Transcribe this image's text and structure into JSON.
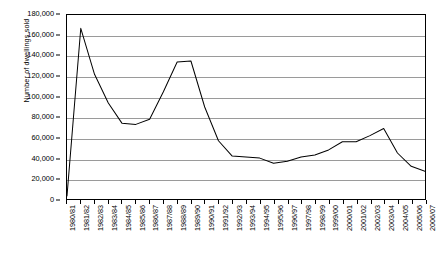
{
  "chart_data": {
    "type": "line",
    "title": "",
    "xlabel": "",
    "ylabel": "Number of dwellings sold",
    "ylim": [
      0,
      180000
    ],
    "ytick_step": 20000,
    "grid": true,
    "legend": false,
    "line_color": "#000000",
    "grid_color": "#9a9a9a",
    "axis_color": "#000000",
    "background": "#ffffff",
    "y_ticks": [
      "0",
      "20,000",
      "40,000",
      "60,000",
      "80,000",
      "100,000",
      "120,000",
      "140,000",
      "160,000",
      "180,000"
    ],
    "y_tick_values": [
      0,
      20000,
      40000,
      60000,
      80000,
      100000,
      120000,
      140000,
      160000,
      180000
    ],
    "categories": [
      "1980/81",
      "1981/82",
      "1982/83",
      "1983/84",
      "1984/85",
      "1985/86",
      "1986/87",
      "1987/88",
      "1988/89",
      "1989/90",
      "1990/91",
      "1991/92",
      "1992/93",
      "1993/94",
      "1994/95",
      "1995/96",
      "1996/97",
      "1997/98",
      "1998/99",
      "1999/00",
      "2000/01",
      "2001/02",
      "2002/03",
      "2003/04",
      "2004/05",
      "2005/06",
      "2006/07"
    ],
    "values": [
      3000,
      167000,
      122000,
      94000,
      74000,
      73000,
      78000,
      105000,
      134000,
      135000,
      90000,
      57000,
      42000,
      41000,
      40000,
      35000,
      37000,
      41000,
      43000,
      48000,
      56000,
      56000,
      62000,
      69000,
      45000,
      32000,
      27000
    ]
  }
}
